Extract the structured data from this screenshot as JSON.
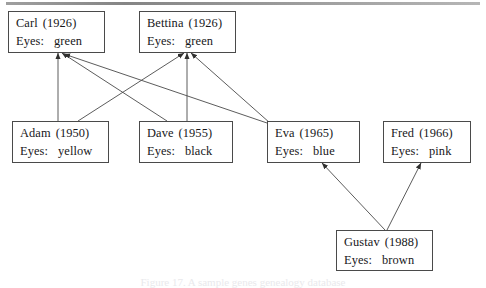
{
  "figure": {
    "kind": "family-tree-diagram",
    "caption": "Figure 17. A sample genes genealogy database",
    "background": "#ffffff",
    "line_color": "#4a4a4a",
    "text_color": "#17171a"
  },
  "labels": {
    "eyes_prefix": "Eyes:"
  },
  "nodes": [
    {
      "id": "carl",
      "name": "Carl",
      "year": "(1926)",
      "eyes": "green",
      "x": 8,
      "y": 11,
      "w": 97,
      "h": 42
    },
    {
      "id": "bettina",
      "name": "Bettina",
      "year": "(1926)",
      "eyes": "green",
      "x": 139,
      "y": 11,
      "w": 97,
      "h": 42
    },
    {
      "id": "adam",
      "name": "Adam",
      "year": "(1950)",
      "eyes": "yellow",
      "x": 12,
      "y": 121,
      "w": 97,
      "h": 42
    },
    {
      "id": "dave",
      "name": "Dave",
      "year": "(1955)",
      "eyes": "black",
      "x": 139,
      "y": 121,
      "w": 94,
      "h": 42
    },
    {
      "id": "eva",
      "name": "Eva",
      "year": "(1965)",
      "eyes": "blue",
      "x": 267,
      "y": 121,
      "w": 93,
      "h": 42
    },
    {
      "id": "fred",
      "name": "Fred",
      "year": "(1966)",
      "eyes": "pink",
      "x": 383,
      "y": 121,
      "w": 88,
      "h": 42
    },
    {
      "id": "gustav",
      "name": "Gustav",
      "year": "(1988)",
      "eyes": "brown",
      "x": 336,
      "y": 230,
      "w": 97,
      "h": 41
    }
  ],
  "edges": [
    {
      "id": "adam-carl",
      "from": "adam",
      "to": "carl",
      "x1": 58,
      "y1": 121,
      "x2": 58,
      "y2": 53
    },
    {
      "id": "adam-bettina",
      "from": "adam",
      "to": "bettina",
      "x1": 78,
      "y1": 121,
      "x2": 184,
      "y2": 53
    },
    {
      "id": "dave-carl",
      "from": "dave",
      "to": "carl",
      "x1": 167,
      "y1": 121,
      "x2": 62,
      "y2": 53
    },
    {
      "id": "dave-bettina",
      "from": "dave",
      "to": "bettina",
      "x1": 187,
      "y1": 121,
      "x2": 187,
      "y2": 53
    },
    {
      "id": "eva-carl",
      "from": "eva",
      "to": "carl",
      "x1": 270,
      "y1": 124,
      "x2": 64,
      "y2": 54
    },
    {
      "id": "eva-bettina",
      "from": "eva",
      "to": "bettina",
      "x1": 270,
      "y1": 123,
      "x2": 191,
      "y2": 53
    },
    {
      "id": "gustav-eva",
      "from": "gustav",
      "to": "eva",
      "x1": 385,
      "y1": 230,
      "x2": 322,
      "y2": 163
    },
    {
      "id": "gustav-fred",
      "from": "gustav",
      "to": "fred",
      "x1": 387,
      "y1": 230,
      "x2": 421,
      "y2": 163
    }
  ]
}
